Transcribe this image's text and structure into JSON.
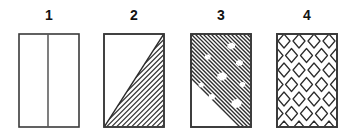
{
  "plate": {
    "background_color": "#ffffff",
    "ink_color": "#1a1a1a",
    "figure_count": 4
  },
  "figures": [
    {
      "label": "1",
      "pattern_name": "divided-blank-rectangle",
      "description": "Plain rectangle divided by one vertical line left of center",
      "fill": "none",
      "outline_color": "#333333",
      "divider_position_fraction": 0.48
    },
    {
      "label": "2",
      "pattern_name": "half-diagonal-hatch",
      "description": "Rectangle with a diagonal from bottom-left to top-right; lower-right triangle filled with parallel diagonal hatching",
      "fill": "diagonal-hatch-lower-right-triangle",
      "outline_color": "#333333",
      "hatch_direction": "up-right",
      "hatch_spacing_px": 3.4
    },
    {
      "label": "3",
      "pattern_name": "dense-hatch-with-blobs",
      "description": "Rectangle fully covered with dense down-right diagonal hatching interrupted by scattered irregular white blobs",
      "fill": "full-diagonal-hatch",
      "outline_color": "#333333",
      "hatch_direction": "down-right",
      "hatch_spacing_px": 3.0,
      "blob_count": 11
    },
    {
      "label": "4",
      "pattern_name": "diamond-lattice",
      "description": "Rectangle filled with a staggered lattice of open diamond outlines",
      "fill": "diamond-outline-lattice",
      "outline_color": "#333333",
      "diamond_columns": 4,
      "diamond_rows": 6
    }
  ]
}
